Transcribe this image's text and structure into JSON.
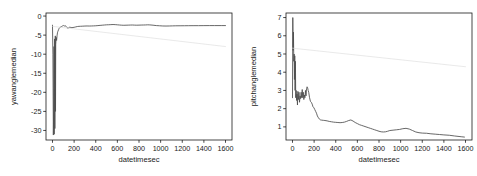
{
  "figure": {
    "background": "#ffffff",
    "line_color": "#4d4d4d",
    "trend_color": "#dcdcdc",
    "axis_color": "#1a1a1a",
    "panel_count": 2
  },
  "chart_data": [
    {
      "type": "line",
      "panel": "left",
      "title": "",
      "xlabel": "datetimesec",
      "ylabel": "yawanglemedian",
      "xlim": [
        -60,
        1660
      ],
      "ylim": [
        -32.5,
        0.8
      ],
      "xticks": [
        0,
        200,
        400,
        600,
        800,
        1000,
        1200,
        1400,
        1600
      ],
      "xticklabels": [
        "0",
        "200",
        "400",
        "600",
        "800",
        "1000",
        "1200",
        "1400",
        "1600"
      ],
      "yticks": [
        0,
        -5,
        -10,
        -15,
        -20,
        -25,
        -30
      ],
      "yticklabels": [
        "0",
        "-5",
        "-10",
        "-15",
        "-20",
        "-25",
        "-30"
      ],
      "grid": false,
      "legend": "none",
      "series": [
        {
          "name": "yawanglemedian",
          "style": "solid",
          "color": "#4d4d4d",
          "x": [
            0,
            4,
            8,
            12,
            14,
            16,
            18,
            20,
            22,
            24,
            26,
            28,
            30,
            34,
            38,
            42,
            46,
            50,
            56,
            62,
            68,
            74,
            80,
            86,
            92,
            98,
            104,
            110,
            118,
            126,
            134,
            142,
            150,
            160,
            170,
            180,
            190,
            200,
            215,
            230,
            245,
            260,
            280,
            300,
            320,
            340,
            360,
            380,
            400,
            420,
            440,
            460,
            480,
            500,
            520,
            540,
            560,
            580,
            600,
            620,
            640,
            660,
            680,
            700,
            720,
            740,
            760,
            780,
            800,
            820,
            840,
            860,
            880,
            900,
            930,
            960,
            990,
            1020,
            1050,
            1080,
            1110,
            1140,
            1180,
            1220,
            1260,
            1300,
            1350,
            1400,
            1450,
            1500,
            1560,
            1600
          ],
          "y": [
            -2.4,
            -10.0,
            -31.2,
            -22.0,
            -8.0,
            -31.0,
            -18.0,
            -6.0,
            -29.5,
            -12.0,
            -5.2,
            -25.0,
            -7.5,
            -5.6,
            -6.4,
            -5.2,
            -4.4,
            -4.0,
            -3.6,
            -3.2,
            -3.0,
            -2.9,
            -2.8,
            -2.7,
            -2.6,
            -2.5,
            -2.5,
            -2.6,
            -2.55,
            -2.7,
            -3.0,
            -3.2,
            -3.1,
            -2.9,
            -3.0,
            -3.05,
            -3.0,
            -2.95,
            -2.85,
            -2.75,
            -2.7,
            -2.68,
            -2.65,
            -2.62,
            -2.6,
            -2.62,
            -2.6,
            -2.58,
            -2.55,
            -2.5,
            -2.45,
            -2.4,
            -2.35,
            -2.3,
            -2.28,
            -2.25,
            -2.22,
            -2.25,
            -2.3,
            -2.35,
            -2.4,
            -2.42,
            -2.4,
            -2.38,
            -2.36,
            -2.35,
            -2.38,
            -2.4,
            -2.38,
            -2.36,
            -2.35,
            -2.33,
            -2.3,
            -2.32,
            -2.4,
            -2.5,
            -2.55,
            -2.6,
            -2.62,
            -2.6,
            -2.58,
            -2.56,
            -2.55,
            -2.54,
            -2.53,
            -2.52,
            -2.52,
            -2.51,
            -2.5,
            -2.5,
            -2.5,
            -2.5
          ]
        },
        {
          "name": "trend",
          "style": "solid-faint",
          "color": "#dcdcdc",
          "x": [
            0,
            1600
          ],
          "y": [
            -2.7,
            -8.0
          ]
        }
      ]
    },
    {
      "type": "line",
      "panel": "right",
      "title": "",
      "xlabel": "datetimesec",
      "ylabel": "pitchanglemedian",
      "xlim": [
        -60,
        1660
      ],
      "ylim": [
        0.28,
        7.25
      ],
      "xticks": [
        0,
        200,
        400,
        600,
        800,
        1000,
        1200,
        1400,
        1600
      ],
      "xticklabels": [
        "0",
        "200",
        "400",
        "600",
        "800",
        "1000",
        "1200",
        "1400",
        "1600"
      ],
      "yticks": [
        1,
        2,
        3,
        4,
        5,
        6,
        7
      ],
      "yticklabels": [
        "1",
        "2",
        "3",
        "4",
        "5",
        "6",
        "7"
      ],
      "grid": false,
      "legend": "none",
      "series": [
        {
          "name": "pitchanglemedian",
          "style": "solid",
          "color": "#4d4d4d",
          "x": [
            0,
            3,
            6,
            9,
            12,
            15,
            18,
            21,
            24,
            27,
            30,
            34,
            38,
            42,
            46,
            50,
            55,
            60,
            65,
            70,
            75,
            80,
            85,
            90,
            95,
            100,
            105,
            110,
            115,
            120,
            125,
            130,
            135,
            140,
            145,
            150,
            158,
            166,
            174,
            182,
            190,
            198,
            206,
            214,
            222,
            230,
            240,
            250,
            260,
            270,
            285,
            300,
            320,
            340,
            360,
            380,
            400,
            420,
            440,
            460,
            480,
            500,
            520,
            540,
            560,
            580,
            600,
            620,
            640,
            660,
            680,
            700,
            720,
            740,
            760,
            780,
            800,
            820,
            840,
            860,
            880,
            900,
            930,
            960,
            990,
            1020,
            1050,
            1080,
            1110,
            1140,
            1170,
            1200,
            1240,
            1280,
            1320,
            1360,
            1400,
            1450,
            1500,
            1560,
            1590
          ],
          "y": [
            2.6,
            7.0,
            5.2,
            6.2,
            4.6,
            5.0,
            3.6,
            4.9,
            3.0,
            4.6,
            2.6,
            3.0,
            2.45,
            2.8,
            2.2,
            2.95,
            2.5,
            2.9,
            2.35,
            2.7,
            2.55,
            2.9,
            2.6,
            3.05,
            2.6,
            2.9,
            2.5,
            2.75,
            2.6,
            3.0,
            2.7,
            3.1,
            3.2,
            3.15,
            3.0,
            2.9,
            2.6,
            2.4,
            2.35,
            2.25,
            2.1,
            2.05,
            1.95,
            1.85,
            1.75,
            1.6,
            1.5,
            1.42,
            1.38,
            1.37,
            1.36,
            1.35,
            1.33,
            1.3,
            1.28,
            1.26,
            1.25,
            1.24,
            1.23,
            1.24,
            1.26,
            1.3,
            1.35,
            1.38,
            1.32,
            1.24,
            1.18,
            1.12,
            1.08,
            1.04,
            1.0,
            0.96,
            0.92,
            0.88,
            0.84,
            0.8,
            0.76,
            0.73,
            0.72,
            0.73,
            0.76,
            0.8,
            0.82,
            0.84,
            0.86,
            0.9,
            0.92,
            0.88,
            0.8,
            0.72,
            0.68,
            0.66,
            0.65,
            0.62,
            0.6,
            0.58,
            0.56,
            0.54,
            0.5,
            0.46,
            0.44
          ]
        },
        {
          "name": "trend",
          "style": "solid-faint",
          "color": "#dcdcdc",
          "x": [
            0,
            1600
          ],
          "y": [
            5.32,
            4.3
          ]
        }
      ]
    }
  ]
}
